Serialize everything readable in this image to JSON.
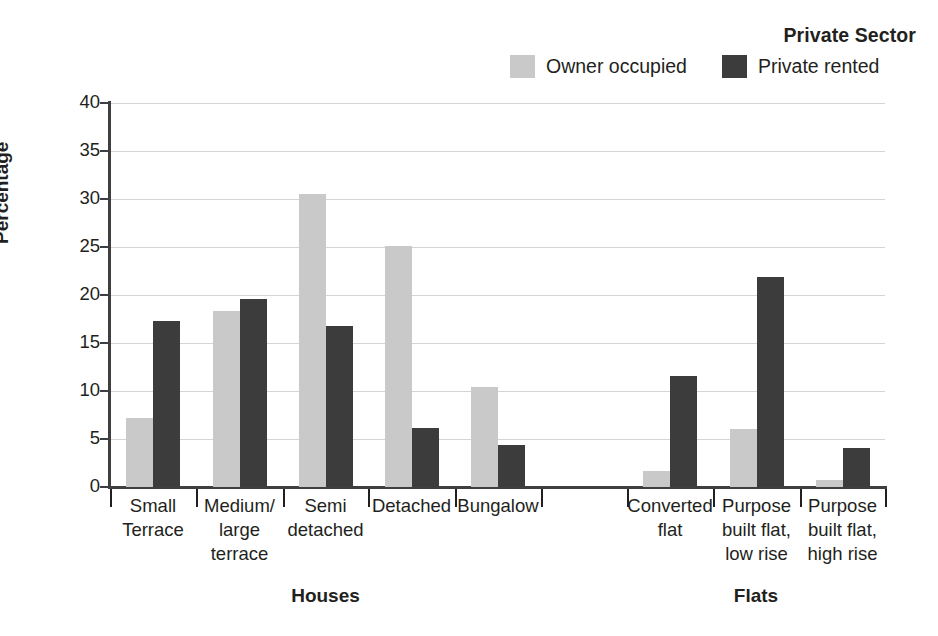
{
  "chart_data": {
    "type": "bar",
    "title": "",
    "xlabel": "",
    "ylabel": "Percentage",
    "ylim": [
      0,
      40
    ],
    "yticks": [
      0,
      5,
      10,
      15,
      20,
      25,
      30,
      35,
      40
    ],
    "grid": true,
    "legend_title": "Private Sector",
    "legend_position": "top-right",
    "categories": [
      "Small Terrace",
      "Medium/ large terrace",
      "Semi detached",
      "Detached",
      "Bungalow",
      "Converted flat",
      "Purpose built flat, low rise",
      "Purpose built flat, high rise"
    ],
    "category_lines": [
      [
        "Small",
        "Terrace"
      ],
      [
        "Medium/",
        "large",
        "terrace"
      ],
      [
        "Semi",
        "detached"
      ],
      [
        "Detached"
      ],
      [
        "Bungalow"
      ],
      [
        "Converted",
        "flat"
      ],
      [
        "Purpose",
        "built flat,",
        "low rise"
      ],
      [
        "Purpose",
        "built flat,",
        "high rise"
      ]
    ],
    "groups": [
      {
        "label": "Houses",
        "categories": [
          0,
          1,
          2,
          3,
          4
        ]
      },
      {
        "label": "Flats",
        "categories": [
          5,
          6,
          7
        ]
      }
    ],
    "series": [
      {
        "name": "Owner occupied",
        "color": "#c9c9c9",
        "values": [
          7.2,
          18.3,
          30.5,
          25.1,
          10.4,
          1.7,
          6.0,
          0.7
        ]
      },
      {
        "name": "Private rented",
        "color": "#3c3c3c",
        "values": [
          17.3,
          19.6,
          16.8,
          6.1,
          4.4,
          11.6,
          21.9,
          4.1
        ]
      }
    ]
  },
  "axis": {
    "y_title": "Percentage"
  },
  "legend": {
    "title": "Private Sector",
    "entries": [
      {
        "label": "Owner occupied"
      },
      {
        "label": "Private rented"
      }
    ]
  }
}
